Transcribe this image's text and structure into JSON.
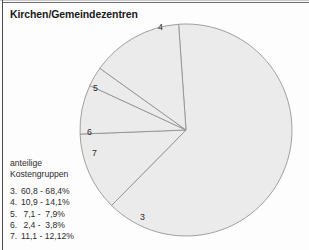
{
  "page": {
    "title": "Kirchen/Gemeindezentren",
    "background_color": "#fdfdfd",
    "frame_color": "#4a4a4a"
  },
  "legend": {
    "heading_line1": "anteilige",
    "heading_line2": "Kostengruppen",
    "entries": [
      {
        "key": "3.",
        "range": "60,8 - 68,4%"
      },
      {
        "key": "4.",
        "range": "10,9 - 14,1%"
      },
      {
        "key": "5.",
        "range": " 7,1 -  7,9%"
      },
      {
        "key": "6.",
        "range": " 2,4 -  3,8%"
      },
      {
        "key": "7.",
        "range": "11,1 - 12,12%"
      }
    ]
  },
  "chart_data": {
    "type": "pie",
    "title": "Kirchen/Gemeindezentren",
    "ylabel": "",
    "xlabel": "",
    "legend_position": "bottom-left",
    "grid": false,
    "slice_fill_color": "#ebebeb",
    "slice_stroke_color": "#8a8a8a",
    "center_x": 186,
    "center_y": 130,
    "radius": 106,
    "start_angle_deg": -94,
    "categories": [
      "3",
      "4",
      "5",
      "6",
      "7"
    ],
    "labels": [
      "3",
      "4",
      "5",
      "6",
      "7"
    ],
    "values": [
      63.5,
      12.0,
      7.5,
      3.0,
      14.0
    ],
    "units": "percent",
    "slices": [
      {
        "label": "3",
        "name": "Kostengruppe 3",
        "value": 63.5,
        "range": "60,8 - 68,4%",
        "label_x": 140,
        "label_y": 212
      },
      {
        "label": "4",
        "name": "Kostengruppe 4",
        "value": 12.0,
        "range": "10,9 - 14,1%",
        "label_x": 158,
        "label_y": 22
      },
      {
        "label": "5",
        "name": "Kostengruppe 5",
        "value": 7.5,
        "range": "7,1 - 7,9%",
        "label_x": 93,
        "label_y": 83
      },
      {
        "label": "6",
        "name": "Kostengruppe 6",
        "value": 3.0,
        "range": "2,4 - 3,8%",
        "label_x": 87,
        "label_y": 127
      },
      {
        "label": "7",
        "name": "Kostengruppe 7",
        "value": 14.0,
        "range": "11,1 - 12,12%",
        "label_x": 92,
        "label_y": 148
      }
    ]
  }
}
